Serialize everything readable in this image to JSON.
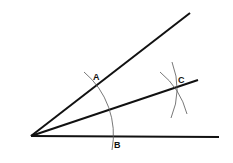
{
  "diagram": {
    "vertex": {
      "x": 31,
      "y": 136
    },
    "rays": [
      {
        "name": "upper-ray",
        "end": {
          "x": 190,
          "y": 13
        }
      },
      {
        "name": "bisector-ray",
        "end": {
          "x": 198,
          "y": 80
        }
      },
      {
        "name": "lower-ray",
        "end": {
          "x": 219,
          "y": 137
        }
      }
    ],
    "points": [
      {
        "label": "A",
        "x": 97,
        "y": 84
      },
      {
        "label": "B",
        "x": 113,
        "y": 137
      },
      {
        "label": "C",
        "x": 176,
        "y": 87
      }
    ],
    "labels": {
      "A": "A",
      "B": "B",
      "C": "C"
    },
    "colors": {
      "line": "#111111",
      "arc": "#555555",
      "background": "#ffffff"
    }
  }
}
